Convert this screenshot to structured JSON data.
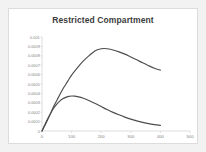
{
  "chart_data": {
    "type": "line",
    "title": "Restricted Compartment",
    "xlabel": "",
    "ylabel": "",
    "xlim": [
      0,
      500
    ],
    "ylim": [
      0,
      0.001
    ],
    "grid": false,
    "legend": "none",
    "xticks": [
      "0",
      "100",
      "200",
      "300",
      "400",
      "500"
    ],
    "xtick_values": [
      0,
      100,
      200,
      300,
      400,
      500
    ],
    "yticks": [
      "0",
      "0.0001",
      "0.0002",
      "0.0003",
      "0.0004",
      "0.0005",
      "0.0006",
      "0.0007",
      "0.0008",
      "0.0009",
      "0.001"
    ],
    "ytick_values": [
      0,
      0.0001,
      0.0002,
      0.0003,
      0.0004,
      0.0005,
      0.0006,
      0.0007,
      0.0008,
      0.0009,
      0.001
    ],
    "series": [
      {
        "name": "upper-curve",
        "color": "#4d4d4d",
        "x": [
          0,
          10,
          20,
          30,
          40,
          50,
          60,
          70,
          80,
          90,
          100,
          120,
          140,
          160,
          180,
          200,
          210,
          220,
          240,
          260,
          280,
          300,
          320,
          340,
          360,
          380,
          400
        ],
        "values": [
          0.0,
          6e-05,
          0.000125,
          0.000195,
          0.000265,
          0.000325,
          0.000385,
          0.000445,
          0.000495,
          0.000545,
          0.000595,
          0.000675,
          0.000745,
          0.000805,
          0.000855,
          0.000875,
          0.000878,
          0.000875,
          0.000862,
          0.000842,
          0.000818,
          0.000788,
          0.000757,
          0.000725,
          0.000695,
          0.000668,
          0.000648
        ]
      },
      {
        "name": "lower-curve",
        "color": "#4d4d4d",
        "x": [
          0,
          10,
          20,
          30,
          40,
          50,
          60,
          70,
          80,
          90,
          100,
          110,
          120,
          140,
          160,
          180,
          200,
          220,
          240,
          260,
          280,
          300,
          320,
          340,
          360,
          380,
          400
        ],
        "values": [
          0.0,
          7e-05,
          0.000135,
          0.000195,
          0.000245,
          0.000285,
          0.000318,
          0.000342,
          0.000358,
          0.000368,
          0.000372,
          0.000371,
          0.000366,
          0.000348,
          0.000322,
          0.000292,
          0.00026,
          0.000228,
          0.000198,
          0.000172,
          0.000148,
          0.000126,
          0.000108,
          9.2e-05,
          7.8e-05,
          6.8e-05,
          6e-05
        ]
      }
    ]
  },
  "style": {
    "card_background": "#ffffff",
    "page_background": "#f2f2f2",
    "border_color": "#dcdcdc",
    "title_color": "#3c3c3c",
    "tick_color": "#808080",
    "axis_color": "#c8c8c8"
  }
}
